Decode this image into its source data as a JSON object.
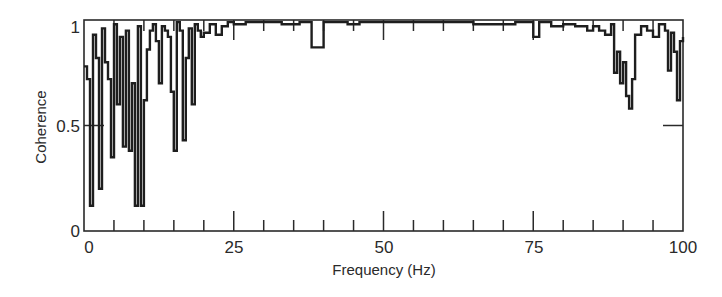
{
  "chart_data": {
    "type": "line",
    "title": "",
    "xlabel": "Frequency (Hz)",
    "ylabel": "Coherence",
    "xlim": [
      0,
      100
    ],
    "ylim": [
      0,
      1
    ],
    "x_ticks": [
      0,
      25,
      50,
      75,
      100
    ],
    "x_tick_labels": [
      "0",
      "25",
      "50",
      "75",
      "100"
    ],
    "x_minor_tick_step": 5,
    "y_ticks": [
      0,
      0.5,
      1
    ],
    "y_tick_labels": [
      "0",
      "0.5",
      "1"
    ],
    "grid": false,
    "legend": null,
    "series": [
      {
        "name": "Coherence",
        "color": "#1e1e1e",
        "x": [
          0,
          0.5,
          1,
          1.5,
          2,
          2.5,
          3,
          3.5,
          4,
          4.5,
          5,
          5.5,
          6,
          6.5,
          7,
          7.5,
          8,
          8.5,
          9,
          9.5,
          10,
          10.5,
          11,
          11.5,
          12,
          12.5,
          13,
          13.5,
          14,
          14.5,
          15,
          15.5,
          16,
          16.5,
          17,
          17.5,
          18,
          18.5,
          19,
          19.5,
          20,
          21,
          22,
          23,
          24,
          25,
          27,
          30,
          33,
          36,
          38,
          40,
          42,
          44,
          46,
          48,
          50,
          55,
          60,
          65,
          70,
          72,
          75,
          76,
          78,
          80,
          82,
          84,
          85,
          86,
          87,
          88,
          88.5,
          89,
          89.5,
          90,
          90.5,
          91,
          91.5,
          92,
          93,
          94,
          95,
          96,
          97,
          97.5,
          98,
          98.5,
          99,
          99.5,
          100
        ],
        "values": [
          0.78,
          0.72,
          0.12,
          0.93,
          0.82,
          0.2,
          0.96,
          0.8,
          0.72,
          0.35,
          0.98,
          0.6,
          0.92,
          0.4,
          0.95,
          0.38,
          0.7,
          0.12,
          0.97,
          0.12,
          0.62,
          0.86,
          0.95,
          0.98,
          0.9,
          0.7,
          0.97,
          0.95,
          0.92,
          0.66,
          0.38,
          0.99,
          0.95,
          0.43,
          0.82,
          0.96,
          0.6,
          0.98,
          0.95,
          0.92,
          0.94,
          0.98,
          0.93,
          0.97,
          0.99,
          0.98,
          0.99,
          0.99,
          0.98,
          0.99,
          0.87,
          0.99,
          0.99,
          0.98,
          0.99,
          0.99,
          0.99,
          0.99,
          0.99,
          0.98,
          0.98,
          0.99,
          0.92,
          0.99,
          0.97,
          0.98,
          0.97,
          0.95,
          0.97,
          0.95,
          0.93,
          0.98,
          0.75,
          0.85,
          0.7,
          0.8,
          0.64,
          0.58,
          0.72,
          0.93,
          0.97,
          0.95,
          0.92,
          0.98,
          0.95,
          0.76,
          0.94,
          0.85,
          0.62,
          0.9,
          0.92
        ]
      }
    ]
  },
  "axes": {
    "x_title": "Frequency (Hz)",
    "y_title": "Coherence",
    "x_tick_labels": [
      "0",
      "25",
      "50",
      "75",
      "100"
    ],
    "y_tick_labels": [
      "0",
      "0.5",
      "1"
    ]
  }
}
